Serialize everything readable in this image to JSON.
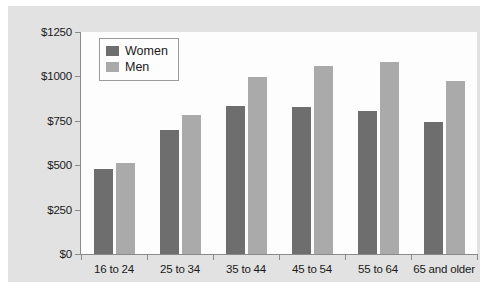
{
  "chart_data": {
    "type": "bar",
    "title": "",
    "subtitle": "",
    "xlabel": "",
    "ylabel": "",
    "categories": [
      "16 to 24",
      "25 to 34",
      "35 to 44",
      "45 to 54",
      "55 to 64",
      "65 and older"
    ],
    "series": [
      {
        "name": "Women",
        "color": "#6e6e6e",
        "values": [
          480,
          700,
          835,
          830,
          805,
          745
        ]
      },
      {
        "name": "Men",
        "color": "#aaaaaa",
        "values": [
          510,
          785,
          995,
          1060,
          1080,
          975
        ]
      }
    ],
    "ylim": [
      0,
      1250
    ],
    "yticks": [
      0,
      250,
      500,
      750,
      1000,
      1250
    ],
    "ytick_labels": [
      "$0",
      "$250",
      "$500",
      "$750",
      "$1000",
      "$1250"
    ],
    "grid": false,
    "legend_position": "top-left",
    "background_color": "#e2e2e2",
    "plot_background_color": "#fdfdfd",
    "axis_color": "#8a8a8a"
  }
}
